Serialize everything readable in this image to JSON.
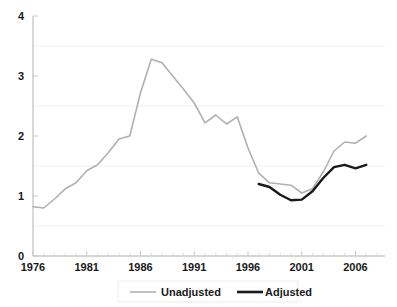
{
  "chart_data": {
    "type": "line",
    "title": "",
    "xlabel": "",
    "ylabel": "",
    "xlim": [
      1976,
      2008
    ],
    "ylim": [
      0,
      4
    ],
    "grid": "faint-horizontal",
    "legend_position": "bottom-center",
    "y_ticks": [
      "0",
      "1",
      "2",
      "3",
      "4"
    ],
    "y_tick_values": [
      0,
      1,
      2,
      3,
      4
    ],
    "x_ticks": [
      "1976",
      "1981",
      "1986",
      "1991",
      "1996",
      "2001",
      "2006"
    ],
    "x_tick_values": [
      1976,
      1981,
      1986,
      1991,
      1996,
      2001,
      2006
    ],
    "x_minor_tick_interval": 1,
    "series": [
      {
        "name": "Unadjusted",
        "color": "#b0b0b0",
        "width": 1.6,
        "x": [
          1976,
          1977,
          1978,
          1979,
          1980,
          1981,
          1982,
          1983,
          1984,
          1985,
          1986,
          1987,
          1988,
          1989,
          1990,
          1991,
          1992,
          1993,
          1994,
          1995,
          1996,
          1997,
          1998,
          1999,
          2000,
          2001,
          2002,
          2003,
          2004,
          2005,
          2006,
          2007
        ],
        "values": [
          0.82,
          0.8,
          0.95,
          1.12,
          1.22,
          1.42,
          1.52,
          1.72,
          1.95,
          2.0,
          2.72,
          3.28,
          3.22,
          3.0,
          2.78,
          2.55,
          2.22,
          2.35,
          2.2,
          2.32,
          1.8,
          1.38,
          1.22,
          1.2,
          1.18,
          1.05,
          1.12,
          1.4,
          1.75,
          1.9,
          1.88,
          2.0
        ]
      },
      {
        "name": "Adjusted",
        "color": "#1a1a1a",
        "width": 2.4,
        "x": [
          1997,
          1998,
          1999,
          2000,
          2001,
          2002,
          2003,
          2004,
          2005,
          2006,
          2007
        ],
        "values": [
          1.2,
          1.15,
          1.02,
          0.93,
          0.94,
          1.08,
          1.3,
          1.48,
          1.52,
          1.46,
          1.52
        ]
      }
    ]
  },
  "legend": {
    "entries": [
      {
        "label": "Unadjusted",
        "color": "#b0b0b0"
      },
      {
        "label": "Adjusted",
        "color": "#1a1a1a"
      }
    ]
  }
}
